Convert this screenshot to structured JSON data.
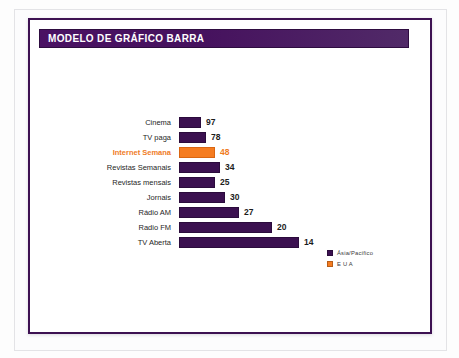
{
  "slide": {
    "title": "MODELO DE GRÁFICO BARRA",
    "title_bg": "#46125e",
    "border_color": "#3d1152"
  },
  "chart_data": {
    "type": "bar",
    "orientation": "horizontal",
    "title": "MODELO DE GRÁFICO BARRA",
    "xlabel": "",
    "ylabel": "",
    "grid": false,
    "legend_position": "bottom-right",
    "categories": [
      "Cinema",
      "TV paga",
      "Internet Semana",
      "Revistas Semanais",
      "Revistas mensais",
      "Jornais",
      "Rádio AM",
      "Radio FM",
      "TV Aberta"
    ],
    "values": [
      97,
      78,
      48,
      34,
      25,
      30,
      27,
      20,
      14
    ],
    "bar_lengths_px": [
      22,
      27,
      36,
      41,
      36,
      46,
      60,
      93,
      120
    ],
    "highlight_index": 2,
    "colors": {
      "primary": "#3b1050",
      "accent": "#f57c20"
    },
    "legend": [
      {
        "label": "Ásia/Pacífico",
        "color": "#3b1050"
      },
      {
        "label": "E U A",
        "color": "#f57c20"
      }
    ]
  }
}
